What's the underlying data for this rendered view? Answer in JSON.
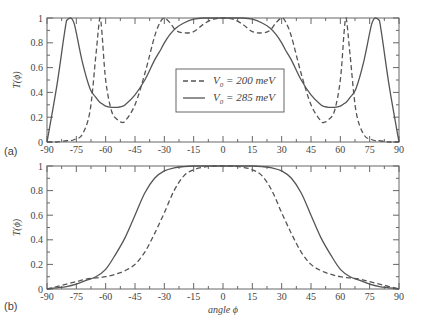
{
  "chart_data": [
    {
      "panel": "(a)",
      "type": "line",
      "title": "",
      "xlabel": "",
      "ylabel": "T(ϕ)",
      "xlim": [
        -90,
        90
      ],
      "ylim": [
        0,
        1
      ],
      "xticks": [
        -90,
        -75,
        -60,
        -45,
        -30,
        -15,
        0,
        15,
        30,
        45,
        60,
        75,
        90
      ],
      "yticks": [
        0,
        0.2,
        0.4,
        0.6,
        0.8,
        1
      ],
      "ytick_labels": [
        "0",
        "0.2",
        "0.4",
        "0.6",
        "0.8",
        "1"
      ],
      "grid": false,
      "legend_position": "center",
      "x": [
        -90,
        -85,
        -80,
        -78,
        -76,
        -72,
        -68,
        -65,
        -63,
        -62,
        -60,
        -57,
        -54,
        -52,
        -50,
        -45,
        -40,
        -35,
        -32,
        -30,
        -27,
        -24,
        -20,
        -15,
        -10,
        -5,
        0,
        5,
        10,
        15,
        20,
        24,
        27,
        30,
        32,
        35,
        40,
        45,
        50,
        52,
        54,
        57,
        60,
        62,
        63,
        65,
        68,
        72,
        76,
        78,
        80,
        85,
        90
      ],
      "series": [
        {
          "name": "V0 = 200 meV",
          "style": "dashed",
          "values": [
            0,
            0,
            0.01,
            0.01,
            0.02,
            0.06,
            0.25,
            0.7,
            1.0,
            0.9,
            0.5,
            0.25,
            0.18,
            0.16,
            0.17,
            0.3,
            0.55,
            0.85,
            0.97,
            1.0,
            0.96,
            0.9,
            0.88,
            0.89,
            0.95,
            0.99,
            1.0,
            0.99,
            0.95,
            0.89,
            0.88,
            0.9,
            0.96,
            1.0,
            0.97,
            0.85,
            0.55,
            0.3,
            0.17,
            0.16,
            0.18,
            0.25,
            0.5,
            0.9,
            1.0,
            0.7,
            0.25,
            0.06,
            0.02,
            0.01,
            0.01,
            0,
            0
          ]
        },
        {
          "name": "V0 = 285 meV",
          "style": "solid",
          "values": [
            0,
            0.45,
            0.98,
            1.0,
            0.95,
            0.65,
            0.43,
            0.36,
            0.32,
            0.31,
            0.29,
            0.28,
            0.28,
            0.285,
            0.3,
            0.38,
            0.5,
            0.66,
            0.74,
            0.8,
            0.87,
            0.92,
            0.96,
            0.99,
            1.0,
            1.0,
            1.0,
            1.0,
            1.0,
            0.99,
            0.96,
            0.92,
            0.87,
            0.8,
            0.74,
            0.66,
            0.5,
            0.38,
            0.3,
            0.285,
            0.28,
            0.28,
            0.29,
            0.31,
            0.32,
            0.36,
            0.43,
            0.65,
            0.95,
            1.0,
            0.98,
            0.45,
            0
          ]
        }
      ]
    },
    {
      "panel": "(b)",
      "type": "line",
      "title": "",
      "xlabel": "angle ϕ",
      "ylabel": "T(ϕ)",
      "xlim": [
        -90,
        90
      ],
      "ylim": [
        0,
        1
      ],
      "xticks": [
        -90,
        -75,
        -60,
        -45,
        -30,
        -15,
        0,
        15,
        30,
        45,
        60,
        75,
        90
      ],
      "yticks": [
        0,
        0.2,
        0.4,
        0.6,
        0.8,
        1
      ],
      "ytick_labels": [
        "0",
        "0.2",
        "0.4",
        "0.6",
        "0.8",
        "1"
      ],
      "grid": false,
      "x": [
        -90,
        -85,
        -80,
        -75,
        -70,
        -65,
        -60,
        -55,
        -50,
        -45,
        -40,
        -35,
        -30,
        -25,
        -20,
        -15,
        -10,
        -5,
        0,
        5,
        10,
        15,
        20,
        25,
        30,
        35,
        40,
        45,
        50,
        55,
        60,
        65,
        70,
        75,
        80,
        85,
        90
      ],
      "series": [
        {
          "name": "V0 = 200 meV",
          "style": "dashed",
          "values": [
            0,
            0.02,
            0.04,
            0.06,
            0.08,
            0.09,
            0.1,
            0.12,
            0.15,
            0.2,
            0.3,
            0.45,
            0.62,
            0.8,
            0.92,
            0.97,
            0.99,
            1.0,
            1.0,
            1.0,
            0.99,
            0.97,
            0.92,
            0.8,
            0.62,
            0.45,
            0.3,
            0.2,
            0.15,
            0.12,
            0.1,
            0.09,
            0.08,
            0.06,
            0.04,
            0.02,
            0
          ]
        },
        {
          "name": "V0 = 285 meV",
          "style": "solid",
          "values": [
            0,
            0.01,
            0.02,
            0.04,
            0.07,
            0.1,
            0.16,
            0.28,
            0.42,
            0.6,
            0.78,
            0.9,
            0.96,
            0.985,
            0.995,
            1.0,
            1.0,
            1.0,
            1.0,
            1.0,
            1.0,
            1.0,
            0.995,
            0.985,
            0.96,
            0.9,
            0.78,
            0.6,
            0.42,
            0.28,
            0.16,
            0.1,
            0.07,
            0.04,
            0.02,
            0.01,
            0
          ]
        }
      ]
    }
  ],
  "figure": {
    "panel_a_label": "(a)",
    "panel_b_label": "(b)",
    "ylabel": "T(ϕ)",
    "xlabel": "angle ϕ",
    "legend": [
      {
        "style": "dashed",
        "sub": "0",
        "prefix": "V",
        "text": " = 200 meV"
      },
      {
        "style": "solid",
        "sub": "0",
        "prefix": "V",
        "text": " = 285 meV"
      }
    ],
    "line_color": "#555555"
  }
}
